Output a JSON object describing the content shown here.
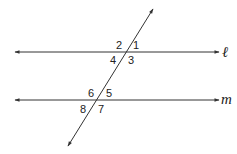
{
  "diagram": {
    "type": "parallel-lines-transversal",
    "line_color": "#333333",
    "lines": [
      {
        "name": "l",
        "label": "ℓ",
        "x1": 15,
        "y": 52,
        "x2": 219
      },
      {
        "name": "m",
        "label": "m",
        "x1": 15,
        "y": 100,
        "x2": 219
      }
    ],
    "transversal": {
      "x1": 153,
      "y1": 9,
      "x2": 68,
      "y2": 146
    },
    "angles": [
      {
        "label": "1",
        "x": 133,
        "y": 49
      },
      {
        "label": "2",
        "x": 116,
        "y": 49
      },
      {
        "label": "3",
        "x": 128,
        "y": 64
      },
      {
        "label": "4",
        "x": 110,
        "y": 64
      },
      {
        "label": "5",
        "x": 106,
        "y": 97
      },
      {
        "label": "6",
        "x": 88,
        "y": 97
      },
      {
        "label": "7",
        "x": 98,
        "y": 113
      },
      {
        "label": "8",
        "x": 80,
        "y": 113
      }
    ]
  }
}
